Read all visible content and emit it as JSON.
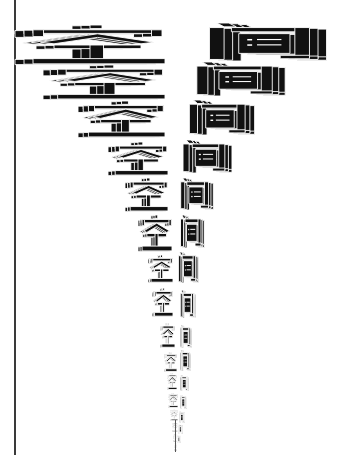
{
  "artwork": {
    "word": "空间",
    "left_column": {
      "char": "空",
      "count": 16,
      "extrusion_direction": "left"
    },
    "right_column": {
      "char": "间",
      "count": 15,
      "extrusion_direction": "right"
    },
    "arrangement": "two descending columns shrinking to a point (V shape)"
  },
  "colors": {
    "ink": "#111111",
    "background": "#ffffff",
    "rule": "#3a3a3a"
  }
}
